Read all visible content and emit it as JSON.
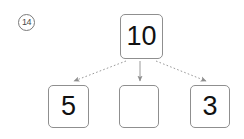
{
  "worksheet": {
    "background_color": "#ffffff",
    "item_marker": {
      "label": "14",
      "shape": "circled-number"
    }
  },
  "diagram": {
    "type": "number-bond-decomposition",
    "title": "",
    "source_box": {
      "name": "total",
      "value": "10"
    },
    "target_boxes": [
      {
        "name": "part-left",
        "value": "5",
        "filled": true
      },
      {
        "name": "part-middle",
        "value": "",
        "filled": false
      },
      {
        "name": "part-right",
        "value": "3",
        "filled": true
      }
    ],
    "arrows": [
      {
        "from": "total",
        "to": "part-left",
        "style": "dotted",
        "direction": "down-left"
      },
      {
        "from": "total",
        "to": "part-middle",
        "style": "solid",
        "direction": "down"
      },
      {
        "from": "total",
        "to": "part-right",
        "style": "dotted",
        "direction": "down-right"
      }
    ],
    "colors": {
      "box_border": "#8f8f8f",
      "text": "#111111",
      "arrow": "#9a9a9a",
      "marker_border": "#7a7a7a"
    }
  }
}
